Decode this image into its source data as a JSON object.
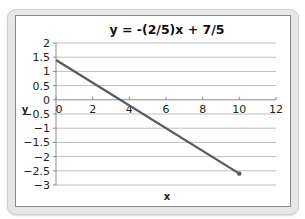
{
  "chart_data": {
    "type": "line",
    "title": "y = -(2/5)x + 7/5",
    "xlabel": "x",
    "ylabel": "y",
    "xlim": [
      0,
      12
    ],
    "ylim": [
      -3,
      2
    ],
    "x_ticks": [
      0,
      2,
      4,
      6,
      8,
      10,
      12
    ],
    "x_tick_labels": [
      "0",
      "2",
      "4",
      "6",
      "8",
      "10",
      "12"
    ],
    "y_ticks": [
      2,
      1.5,
      1,
      0.5,
      0,
      -0.5,
      -1,
      -1.5,
      -2,
      -2.5,
      -3
    ],
    "y_tick_labels": [
      "2",
      "1.5",
      "1",
      "0.5",
      "0",
      "−0.5",
      "−1",
      "−1.5",
      "−2",
      "−2.5",
      "−3"
    ],
    "grid": true,
    "legend": "none",
    "series": [
      {
        "name": "y = -(2/5)x + 7/5",
        "x": [
          0,
          10
        ],
        "y": [
          1.4,
          -2.6
        ],
        "color": "#595959",
        "marker_at_end": true
      }
    ]
  },
  "colors": {
    "frame": "#e6e6e6",
    "gridline": "#bfbfbf",
    "axis": "#8c8c8c",
    "line": "#595959"
  }
}
